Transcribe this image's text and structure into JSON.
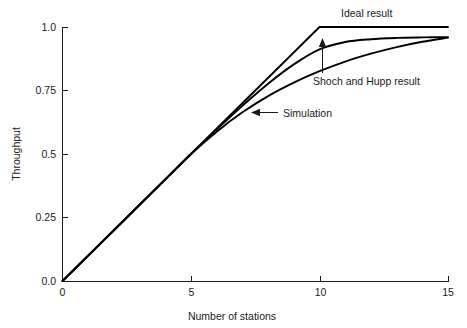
{
  "chart_data": {
    "type": "line",
    "title": "",
    "xlabel": "Number of stations",
    "ylabel": "Throughput",
    "xlim": [
      0,
      15
    ],
    "ylim": [
      0,
      1.0
    ],
    "grid": false,
    "legend_position": "inline-annotations",
    "xticks": [
      "0",
      "5",
      "10",
      "15"
    ],
    "xtick_values": [
      0,
      5,
      10,
      15
    ],
    "yticks": [
      "0.0",
      "0.25",
      "0.5",
      "0.75",
      "1.0"
    ],
    "ytick_values": [
      0,
      0.25,
      0.5,
      0.75,
      1.0
    ],
    "series": [
      {
        "name": "Ideal result",
        "x": [
          0,
          10,
          15
        ],
        "values": [
          0.0,
          1.0,
          1.0
        ]
      },
      {
        "name": "Shoch and Hupp result",
        "x": [
          0,
          1,
          2,
          3,
          4,
          5,
          6,
          7,
          8,
          9,
          10,
          11,
          12,
          13,
          14,
          15
        ],
        "values": [
          0.0,
          0.1,
          0.2,
          0.3,
          0.4,
          0.5,
          0.597,
          0.69,
          0.777,
          0.853,
          0.912,
          0.941,
          0.952,
          0.957,
          0.959,
          0.96
        ]
      },
      {
        "name": "Simulation",
        "x": [
          0,
          1,
          2,
          3,
          4,
          5,
          6,
          7,
          8,
          9,
          10,
          11,
          12,
          13,
          14,
          15
        ],
        "values": [
          0.0,
          0.1,
          0.2,
          0.3,
          0.4,
          0.5,
          0.588,
          0.664,
          0.728,
          0.781,
          0.826,
          0.864,
          0.895,
          0.921,
          0.942,
          0.958
        ]
      }
    ],
    "annotations": [
      {
        "name": "ideal-result",
        "label": "Ideal result",
        "kind": "text-only"
      },
      {
        "name": "shoch-and-hupp-result",
        "label": "Shoch and Hupp result",
        "kind": "vertical-arrow-up"
      },
      {
        "name": "simulation",
        "label": "Simulation",
        "kind": "horizontal-arrow-left"
      }
    ]
  }
}
